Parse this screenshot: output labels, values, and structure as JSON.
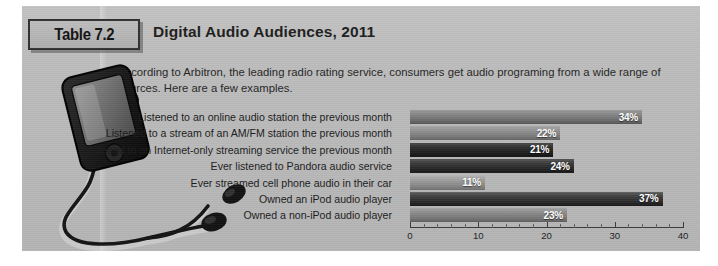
{
  "figure": {
    "badge_label": "Table 7.2",
    "title": "Digital Audio Audiences, 2011",
    "intro": "According to Arbitron, the leading radio rating service, consumers get audio programing from a wide range of sources. Here are a few examples."
  },
  "illustration": {
    "name": "ipod-with-earbuds",
    "device": "portable audio player",
    "accessory": "earbud headphones"
  },
  "chart_data": {
    "type": "bar",
    "orientation": "horizontal",
    "title": "Digital Audio Audiences, 2011",
    "xlabel": "",
    "ylabel": "",
    "xlim": [
      0,
      40
    ],
    "xticks": [
      0,
      10,
      20,
      30,
      40
    ],
    "xtick_labels": [
      "0",
      "10",
      "20",
      "30",
      "40"
    ],
    "grid": false,
    "legend": "none",
    "value_suffix": "%",
    "categories": [
      "Listened to an online audio station the previous month",
      "Listened to a stream of an AM/FM station the previous month",
      "Listened to an Internet-only streaming service the previous month",
      "Ever listened to Pandora audio service",
      "Ever streamed cell phone audio in their car",
      "Owned an iPod audio player",
      "Owned a non-iPod audio player"
    ],
    "values": [
      34,
      22,
      21,
      24,
      11,
      37,
      23
    ],
    "value_labels": [
      "34%",
      "22%",
      "21%",
      "24%",
      "11%",
      "37%",
      "23%"
    ],
    "bar_shades": [
      "shade-mid",
      "shade-midlt",
      "shade-dark",
      "shade-dark2",
      "shade-light",
      "shade-dark3",
      "shade-mid2"
    ]
  },
  "colors": {
    "panel_background": "#b9b9b9",
    "badge_border": "#2f2f2f",
    "text": "#1c1c1c",
    "bar_value_text": "#ffffff",
    "axis": "#3a3a3a"
  }
}
